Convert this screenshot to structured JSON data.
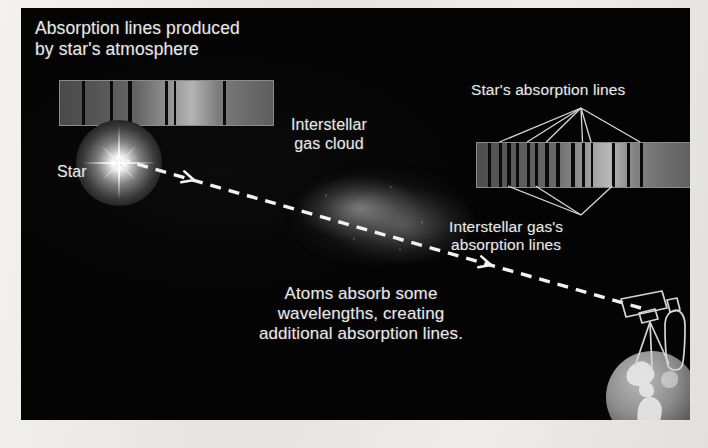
{
  "figure": {
    "domain": "diagram",
    "background_color": "#050505",
    "page_color": "#eceae6",
    "text_color": "#e9e9e9"
  },
  "labels": {
    "title": "Absorption lines produced\nby star's atmosphere",
    "star": "Star",
    "gas_cloud": "Interstellar\ngas cloud",
    "star_absorption_lines": "Star's absorption lines",
    "interstellar_absorption_lines": "Interstellar gas's\nabsorption lines",
    "caption": "Atoms absorb some\nwavelengths, creating\nadditional absorption lines."
  },
  "icons": {
    "star": "star-glow-icon",
    "gas_cloud": "gas-cloud-icon",
    "telescope": "telescope-icon",
    "earth": "earth-globe-icon",
    "light_beam": "dashed-light-beam-icon",
    "arrowhead": "arrowhead-icon"
  },
  "spectra": [
    {
      "name": "star-spectrum",
      "caption_ref": "title",
      "x": 38,
      "y": 72,
      "width": 213,
      "height": 44,
      "border_color": "#8b8b8b",
      "band_stops": [
        {
          "pos": 0,
          "color": "#4a4a4a"
        },
        {
          "pos": 18,
          "color": "#565656"
        },
        {
          "pos": 36,
          "color": "#646464"
        },
        {
          "pos": 50,
          "color": "#8f8f8f"
        },
        {
          "pos": 62,
          "color": "#b4b4b4"
        },
        {
          "pos": 74,
          "color": "#7d7d7d"
        },
        {
          "pos": 88,
          "color": "#6a6a6a"
        },
        {
          "pos": 100,
          "color": "#5e5e5e"
        }
      ],
      "line_positions_pct": [
        11,
        24,
        33,
        50,
        54,
        77
      ],
      "line_widths_px": [
        3,
        3,
        4,
        3,
        2,
        3
      ],
      "line_count": 6
    },
    {
      "name": "observed-spectrum",
      "caption_ref": "star_absorption_lines",
      "x": 455,
      "y": 134,
      "width": 213,
      "height": 44,
      "border_color": "#8b8b8b",
      "band_stops": [
        {
          "pos": 0,
          "color": "#4e4e4e"
        },
        {
          "pos": 18,
          "color": "#5a5a5a"
        },
        {
          "pos": 36,
          "color": "#686868"
        },
        {
          "pos": 50,
          "color": "#949494"
        },
        {
          "pos": 62,
          "color": "#b8b8b8"
        },
        {
          "pos": 74,
          "color": "#828282"
        },
        {
          "pos": 88,
          "color": "#6e6e6e"
        },
        {
          "pos": 100,
          "color": "#606060"
        }
      ],
      "stellar_line_positions_pct": [
        11,
        24,
        33,
        50,
        54,
        77
      ],
      "interstellar_line_positions_pct": [
        6,
        15,
        19,
        28,
        38,
        45,
        64,
        71
      ],
      "line_count": 14
    }
  ],
  "leader_lines": {
    "star_fan": {
      "apex": {
        "x": 560,
        "y": 100
      },
      "targets_pct": [
        11,
        24,
        33,
        50,
        54,
        77
      ],
      "stroke": "#d8d8d8"
    },
    "interstellar_fan": {
      "apex": {
        "x": 560,
        "y": 207
      },
      "targets_pct": [
        15,
        28,
        64
      ],
      "stroke": "#d8d8d8"
    }
  },
  "light_beam": {
    "start": {
      "x": 98,
      "y": 151
    },
    "end": {
      "x": 620,
      "y": 300
    },
    "dash_color": "#f2f2f2",
    "dash_pattern": "11 8",
    "arrowheads": [
      {
        "x": 173,
        "y": 172
      },
      {
        "x": 470,
        "y": 257
      }
    ]
  },
  "objects": {
    "star": {
      "x": 55,
      "y": 112,
      "size": 86
    },
    "gas_cloud": {
      "x": 268,
      "y": 155,
      "width": 185,
      "height": 108
    },
    "telescope": {
      "x": 560,
      "y": 290
    },
    "earth": {
      "x": 585,
      "y": 343,
      "diameter": 92
    }
  }
}
